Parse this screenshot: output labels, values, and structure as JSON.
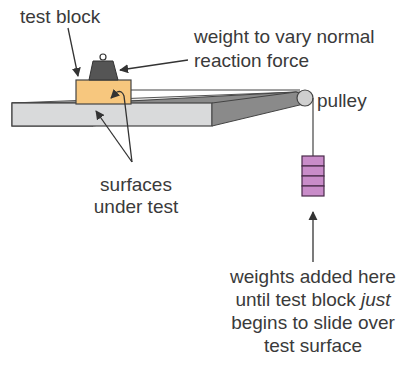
{
  "labels": {
    "test_block": "test block",
    "weight_line1": "weight to vary normal",
    "weight_line2": "reaction force",
    "pulley": "pulley",
    "surfaces_line1": "surfaces",
    "surfaces_line2": "under test",
    "weights_line1": "weights added here",
    "weights_line2_a": "until test block ",
    "weights_line2_b": "just",
    "weights_line3": "begins to slide over",
    "weights_line4": "test surface"
  },
  "colors": {
    "text": "#3a3a3a",
    "block": "#f7c77e",
    "table": "#d9dadb",
    "table_side": "#8a8a8a",
    "weight": "#555555",
    "hanging_weights": "#c98cc9",
    "outline": "#3a3a3a"
  }
}
